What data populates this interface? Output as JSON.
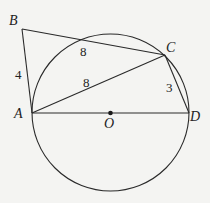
{
  "figure": {
    "type": "geometry",
    "circle": {
      "center_label": "O",
      "cx": 110.5,
      "cy": 112.5,
      "r": 78.5
    },
    "points": {
      "A": {
        "label": "A",
        "x": 32,
        "y": 113
      },
      "B": {
        "label": "B",
        "x": 22,
        "y": 29
      },
      "C": {
        "label": "C",
        "x": 165,
        "y": 55
      },
      "D": {
        "label": "D",
        "x": 189,
        "y": 113
      },
      "O": {
        "label": "O",
        "x": 110.5,
        "y": 113
      }
    },
    "segments": [
      {
        "from": "A",
        "to": "B",
        "length_label": "4"
      },
      {
        "from": "B",
        "to": "C",
        "length_label": "8",
        "note": "label near tangent-like segment B to circle intersection"
      },
      {
        "from": "A",
        "to": "C",
        "length_label": "8"
      },
      {
        "from": "C",
        "to": "D",
        "length_label": "3"
      },
      {
        "from": "A",
        "to": "D",
        "length_label": "",
        "note": "diameter through O"
      }
    ],
    "labels": {
      "B": "B",
      "A": "A",
      "C": "C",
      "D": "D",
      "O": "O",
      "AB_len": "4",
      "BC_len": "8",
      "AC_len": "8",
      "CD_len": "3"
    }
  }
}
